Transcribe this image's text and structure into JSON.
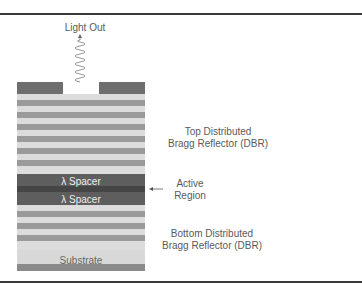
{
  "diagram": {
    "type": "VCSEL layer structure cross-section",
    "labels": {
      "light_out": "Light Out",
      "top_dbr_line1": "Top Distributed",
      "top_dbr_line2": "Bragg Reflector (DBR)",
      "active_line1": "Active",
      "active_line2": "Region",
      "bottom_dbr_line1": "Bottom Distributed",
      "bottom_dbr_line2": "Bragg Reflector (DBR)"
    },
    "layers": {
      "spacer_upper": "λ Spacer",
      "spacer_lower": "λ Spacer",
      "substrate": "Substrate"
    },
    "colors": {
      "contact": "#6e6e6e",
      "dbr_dark": "#9a9a9a",
      "dbr_light": "#dcdcdc",
      "spacer": "#5e5e5e",
      "active_layer": "#454545",
      "substrate": "#d8d8d8",
      "frame": "#3a3a3a"
    }
  }
}
